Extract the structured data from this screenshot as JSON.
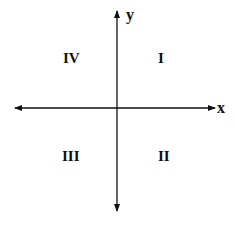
{
  "diagram": {
    "type": "coordinate-plane-quadrants",
    "axes": {
      "x_label": "x",
      "y_label": "y"
    },
    "quadrants": {
      "top_right": "I",
      "bottom_right": "II",
      "bottom_left": "III",
      "top_left": "IV"
    },
    "colors": {
      "line": "#111111",
      "background": "#ffffff"
    }
  }
}
